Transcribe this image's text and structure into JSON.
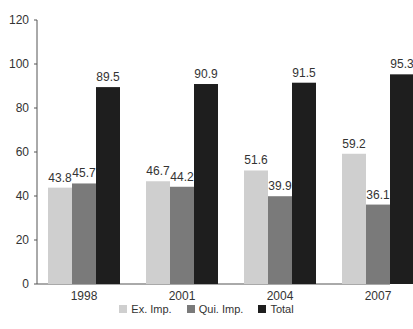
{
  "chart_data": {
    "type": "bar",
    "title": "",
    "xlabel": "",
    "ylabel": "",
    "ylim": [
      0,
      120
    ],
    "yticks": [
      0,
      20,
      40,
      60,
      80,
      100,
      120
    ],
    "grid": false,
    "legend_position": "bottom",
    "categories": [
      "1998",
      "2001",
      "2004",
      "2007"
    ],
    "series": [
      {
        "name": "Ex. Imp.",
        "color": "#cfcfcf",
        "values": [
          43.8,
          46.7,
          51.6,
          59.2
        ]
      },
      {
        "name": "Qui. Imp.",
        "color": "#7a7a7a",
        "values": [
          45.7,
          44.2,
          39.9,
          36.1
        ]
      },
      {
        "name": "Total",
        "color": "#1e1e1e",
        "values": [
          89.5,
          90.9,
          91.5,
          95.3
        ]
      }
    ]
  },
  "legend": {
    "items": [
      {
        "label": "Ex. Imp.",
        "color": "#cfcfcf"
      },
      {
        "label": "Qui. Imp.",
        "color": "#7a7a7a"
      },
      {
        "label": "Total",
        "color": "#1e1e1e"
      }
    ]
  }
}
